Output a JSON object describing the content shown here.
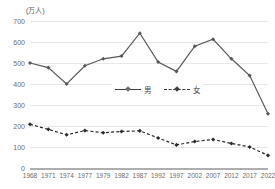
{
  "chart_data": {
    "type": "line",
    "title": "",
    "unit_label": "(万人)",
    "xlabel": "",
    "ylabel": "",
    "categories": [
      "1968",
      "1971",
      "1974",
      "1977",
      "1979",
      "1982",
      "1987",
      "1992",
      "1997",
      "2002",
      "2007",
      "2012",
      "2017",
      "2022"
    ],
    "series": [
      {
        "name": "男",
        "style": "solid",
        "marker": "diamond",
        "color": "#595959",
        "values": [
          500,
          478,
          400,
          487,
          520,
          533,
          642,
          505,
          460,
          580,
          613,
          520,
          440,
          258
        ]
      },
      {
        "name": "女",
        "style": "dashed",
        "marker": "diamond",
        "color": "#2b2b2b",
        "values": [
          208,
          184,
          158,
          178,
          168,
          174,
          177,
          143,
          110,
          126,
          136,
          117,
          100,
          60
        ]
      }
    ],
    "yticks": [
      0,
      100,
      200,
      300,
      400,
      500,
      600,
      700
    ],
    "ylim": [
      0,
      700
    ],
    "grid": true,
    "legend_position": "inside-center"
  },
  "legend": {
    "items": [
      {
        "label": "男"
      },
      {
        "label": "女"
      }
    ]
  }
}
